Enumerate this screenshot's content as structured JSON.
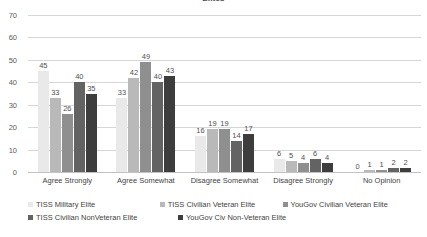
{
  "chart_data": {
    "type": "bar",
    "title": "Elites",
    "xlabel": "",
    "ylabel": "",
    "ylim": [
      0,
      70
    ],
    "yticks": [
      0,
      10,
      20,
      30,
      40,
      50,
      60,
      70
    ],
    "grid": true,
    "legend_position": "bottom",
    "categories": [
      "Agree Strongly",
      "Agree Somewhat",
      "Disagree Somewhat",
      "Disagree Strongly",
      "No Opinion"
    ],
    "series": [
      {
        "name": "TISS Military Elite",
        "color": "#e9e9e9",
        "values": [
          45,
          33,
          16,
          6,
          0
        ]
      },
      {
        "name": "TISS Civilian Veteran Elite",
        "color": "#b9b9b9",
        "values": [
          33,
          42,
          19,
          5,
          1
        ]
      },
      {
        "name": "YouGov Civilian Veteran Elite",
        "color": "#8f8f8f",
        "values": [
          26,
          49,
          19,
          4,
          1
        ]
      },
      {
        "name": "TISS Civilian NonVeteran Elite",
        "color": "#636363",
        "values": [
          40,
          40,
          14,
          6,
          2
        ]
      },
      {
        "name": "YouGov Civ Non-Veteran Elite",
        "color": "#3d3d3d",
        "values": [
          35,
          43,
          17,
          4,
          2
        ]
      }
    ]
  },
  "colors": {
    "gridline": "#d6d6d6",
    "baseline": "#c2c2c2",
    "text": "#3f3f3f",
    "tick_text": "#5b5b5b"
  }
}
